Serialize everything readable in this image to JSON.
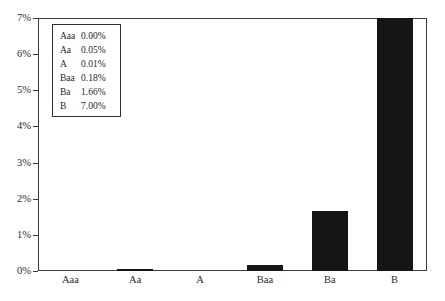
{
  "chart_data": {
    "type": "bar",
    "title": "",
    "subtitle": "",
    "xlabel": "",
    "ylabel": "",
    "categories": [
      "Aaa",
      "Aa",
      "A",
      "Baa",
      "Ba",
      "B"
    ],
    "values": [
      0.0,
      0.05,
      0.01,
      0.18,
      1.66,
      7.0
    ],
    "value_labels": [
      "0.00%",
      "0.05%",
      "0.01%",
      "0.18%",
      "1.66%",
      "7.00%"
    ],
    "ylim": [
      0,
      7
    ],
    "y_ticks": [
      0,
      1,
      2,
      3,
      4,
      5,
      6,
      7
    ],
    "y_tick_labels": [
      "0%",
      "1%",
      "2%",
      "3%",
      "4%",
      "5%",
      "6%",
      "7%"
    ],
    "grid": false,
    "legend_position": "inside-top-left",
    "series": [
      {
        "name": "Default rate",
        "values": [
          0.0,
          0.05,
          0.01,
          0.18,
          1.66,
          7.0
        ],
        "color": "#151515"
      }
    ],
    "annotations": []
  },
  "legend": {
    "rows": [
      {
        "key": "Aaa",
        "value": "0.00%"
      },
      {
        "key": "Aa",
        "value": "0.05%"
      },
      {
        "key": "A",
        "value": "0.01%"
      },
      {
        "key": "Baa",
        "value": "0.18%"
      },
      {
        "key": "Ba",
        "value": "1.66%"
      },
      {
        "key": "B",
        "value": "7.00%"
      }
    ]
  },
  "colors": {
    "bar": "#151515",
    "frame": "#3a3a3a",
    "text": "#2b2b2b",
    "background": "#ffffff"
  }
}
